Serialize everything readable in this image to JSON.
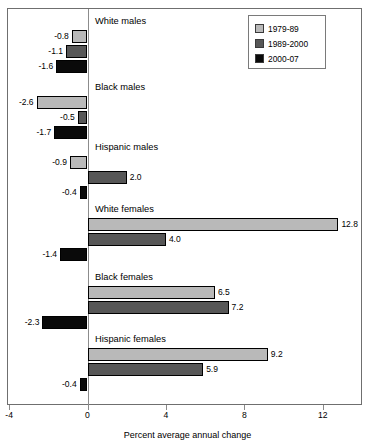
{
  "chart_data": {
    "type": "bar",
    "orientation": "horizontal",
    "title": "",
    "xlabel": "Percent average annual change",
    "ylabel": "",
    "xlim": [
      -4,
      14
    ],
    "xticks": [
      -4,
      0,
      4,
      8,
      12
    ],
    "xtick_labels": [
      "-4",
      "0",
      "4",
      "8",
      "12"
    ],
    "grid": false,
    "legend_position": "top-right",
    "categories": [
      "White males",
      "Black males",
      "Hispanic males",
      "White females",
      "Black females",
      "Hispanic females"
    ],
    "series": [
      {
        "name": "1979-89",
        "color": "#b9b9b9",
        "values": [
          -0.8,
          -2.6,
          -0.9,
          12.8,
          6.5,
          9.2
        ]
      },
      {
        "name": "1989-2000",
        "color": "#575757",
        "values": [
          -1.1,
          -0.5,
          2.0,
          4.0,
          7.2,
          5.9
        ]
      },
      {
        "name": "2000-07",
        "color": "#0a0a0a",
        "values": [
          -1.6,
          -1.7,
          -0.4,
          -1.4,
          -2.3,
          -0.4
        ]
      }
    ],
    "data_labels": [
      [
        "-0.8",
        "-1.1",
        "-1.6"
      ],
      [
        "-2.6",
        "-0.5",
        "-1.7"
      ],
      [
        "-0.9",
        "2.0",
        "-0.4"
      ],
      [
        "12.8",
        "4.0",
        "-1.4"
      ],
      [
        "6.5",
        "7.2",
        "-2.3"
      ],
      [
        "9.2",
        "5.9",
        "-0.4"
      ]
    ]
  },
  "legend": {
    "items": [
      {
        "label": "1979-89",
        "color": "#b9b9b9"
      },
      {
        "label": "1989-2000",
        "color": "#575757"
      },
      {
        "label": "2000-07",
        "color": "#0a0a0a"
      }
    ]
  }
}
